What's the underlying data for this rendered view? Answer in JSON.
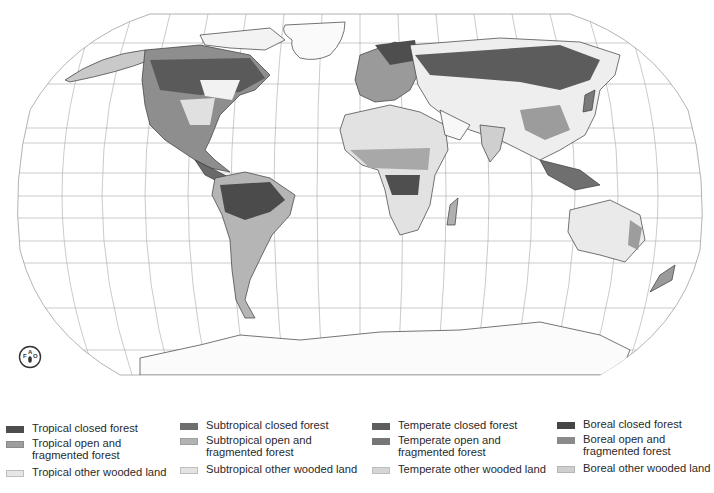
{
  "map": {
    "projection": "Robinson",
    "center_meridian_x": 360,
    "background": "#ffffff",
    "graticule_color": "#9a9a9a",
    "coast_color": "#3a3a3a"
  },
  "logo": {
    "name": "FAO",
    "icon": "fao-emblem-icon"
  },
  "legend": {
    "columns": [
      {
        "zone": "Tropical",
        "items": [
          {
            "label": "Tropical closed forest",
            "color": "#4d4d4d"
          },
          {
            "label_line1": "Tropical open and",
            "label_line2": "fragmented forest",
            "color": "#9e9e9e"
          },
          {
            "label": "Tropical other wooded land",
            "color": "#e6e6e6"
          }
        ]
      },
      {
        "zone": "Subtropical",
        "items": [
          {
            "label": "Subtropical closed forest",
            "color": "#6e6e6e"
          },
          {
            "label_line1": "Subtropical open and",
            "label_line2": "fragmented forest",
            "color": "#b3b3b3"
          },
          {
            "label": "Subtropical other wooded land",
            "color": "#e3e3e3"
          }
        ]
      },
      {
        "zone": "Temperate",
        "items": [
          {
            "label": "Temperate closed forest",
            "color": "#5e5e5e"
          },
          {
            "label_line1": "Temperate open and",
            "label_line2": "fragmented forest",
            "color": "#767676"
          },
          {
            "label": "Temperate other wooded land",
            "color": "#d6d6d6"
          }
        ]
      },
      {
        "zone": "Boreal",
        "items": [
          {
            "label": "Boreal closed forest",
            "color": "#454545"
          },
          {
            "label_line1": "Boreal open and",
            "label_line2": "fragmented forest",
            "color": "#8a8a8a"
          },
          {
            "label": "Boreal other wooded land",
            "color": "#cfcfcf"
          }
        ]
      }
    ]
  }
}
